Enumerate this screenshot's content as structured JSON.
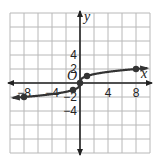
{
  "chart_data": {
    "type": "line",
    "title": "",
    "xlabel": "x",
    "ylabel": "y",
    "origin_label": "O",
    "xlim": [
      -10,
      10
    ],
    "ylim": [
      -10,
      10
    ],
    "grid": true,
    "grid_step": 2,
    "x_ticks": [
      -8,
      -4,
      4,
      8
    ],
    "y_ticks": [
      4,
      2,
      -2,
      -4
    ],
    "x_tick_labels": [
      "−8",
      "−4",
      "4",
      "8"
    ],
    "y_tick_labels": [
      "4",
      "2",
      "−2",
      "−4"
    ],
    "series": [
      {
        "name": "y = cube root of x",
        "function": "cbrt",
        "points": [
          [
            -8,
            -2
          ],
          [
            -1,
            -1
          ],
          [
            0,
            0
          ],
          [
            1,
            1
          ],
          [
            8,
            2
          ]
        ],
        "x_range": [
          -9.6,
          9.6
        ],
        "arrows": "both"
      }
    ],
    "colors": {
      "grid": "#b8b8b8",
      "axis": "#222222",
      "curve": "#333333"
    }
  }
}
